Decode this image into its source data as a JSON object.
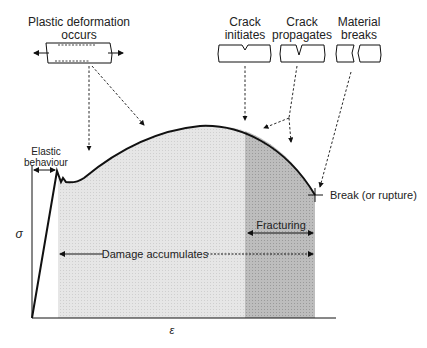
{
  "diagram": {
    "type": "stress-strain curve",
    "axes": {
      "y_label": "σ",
      "x_label": "ε"
    },
    "stages": [
      {
        "id": "plastic",
        "label_line1": "Plastic deformation",
        "label_line2": "occurs"
      },
      {
        "id": "crack-init",
        "label_line1": "Crack",
        "label_line2": "initiates"
      },
      {
        "id": "crack-prop",
        "label_line1": "Crack",
        "label_line2": "propagates"
      },
      {
        "id": "breaks",
        "label_line1": "Material",
        "label_line2": "breaks"
      }
    ],
    "regions": {
      "elastic_line1": "Elastic",
      "elastic_line2": "behaviour",
      "damage": "Damage accumulates",
      "fracturing": "Fracturing",
      "break": "Break (or rupture)"
    },
    "colors": {
      "line": "#111111",
      "light_fill": "#e4e4e4",
      "dark_fill": "#b9b9b9",
      "text": "#222222"
    }
  }
}
